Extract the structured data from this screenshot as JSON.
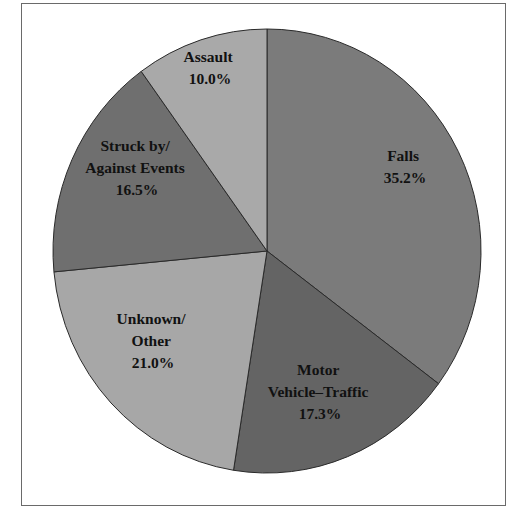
{
  "chart_data": {
    "type": "pie",
    "title": "",
    "start_angle_deg": 0,
    "direction": "clockwise",
    "categories": [
      "Falls",
      "Motor Vehicle–Traffic",
      "Unknown/ Other",
      "Struck by/ Against Events",
      "Assault"
    ],
    "values": [
      35.2,
      17.3,
      21.0,
      16.5,
      10.0
    ],
    "unit": "%",
    "colors": [
      "#7b7b7b",
      "#646464",
      "#a7a7a7",
      "#6f6f6f",
      "#a9a9a9"
    ],
    "legend": "none (labels inside slices)"
  },
  "slices": [
    {
      "name": "falls",
      "lines": [
        "Falls",
        "35.2%"
      ],
      "label_x": 405,
      "label_y": 167
    },
    {
      "name": "motor-vehicle-traffic",
      "lines": [
        "Motor",
        "Vehicle–Traffic",
        "17.3%"
      ],
      "label_x": 320,
      "label_y": 392
    },
    {
      "name": "unknown-other",
      "lines": [
        "Unknown/",
        "Other",
        "21.0%"
      ],
      "label_x": 153,
      "label_y": 341
    },
    {
      "name": "struck-by-against-events",
      "lines": [
        "Struck by/",
        "Against Events",
        "16.5%"
      ],
      "label_x": 137,
      "label_y": 168
    },
    {
      "name": "assault",
      "lines": [
        "Assault",
        "10.0%"
      ],
      "label_x": 210,
      "label_y": 68
    }
  ]
}
